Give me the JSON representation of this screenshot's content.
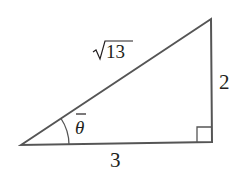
{
  "diagram": {
    "type": "right-triangle",
    "stroke_color": "#555555",
    "text_color": "#231f20",
    "vertices": {
      "left": [
        21,
        145
      ],
      "top_right": [
        211,
        19
      ],
      "bottom_right": [
        212,
        142
      ]
    },
    "labels": {
      "hypotenuse": "13",
      "hypotenuse_prefix": "√",
      "opposite": "2",
      "adjacent": "3",
      "angle": "θ"
    }
  }
}
